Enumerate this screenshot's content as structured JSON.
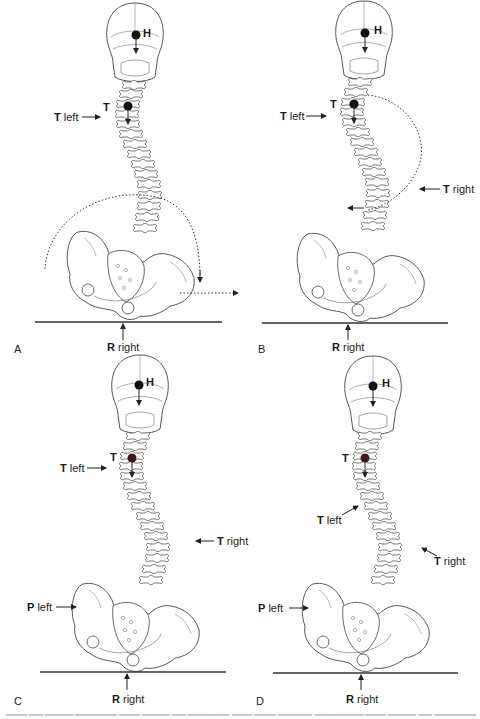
{
  "figure": {
    "type": "anatomical-diagram",
    "line_color": "#3a3a3a",
    "caption_visible": "illegible caption text (cut off)",
    "panels": [
      {
        "letter": "A",
        "labels": {
          "head": "H",
          "thorax": "T",
          "t_left": {
            "bold": "T",
            "text": " left"
          },
          "r_right": {
            "bold": "R",
            "text": " right"
          }
        },
        "annotations": [
          "dotted rotation arc around pelvis",
          "dotted arrow to right"
        ]
      },
      {
        "letter": "B",
        "labels": {
          "head": "H",
          "thorax": "T",
          "t_left": {
            "bold": "T",
            "text": " left"
          },
          "t_right": {
            "bold": "T",
            "text": " right"
          },
          "r_right": {
            "bold": "R",
            "text": " right"
          }
        },
        "annotations": [
          "dotted arc from upper thoracic to lumbar",
          "arrow pointing left at lumbar"
        ]
      },
      {
        "letter": "C",
        "labels": {
          "head": "H",
          "thorax": "T",
          "t_left": {
            "bold": "T",
            "text": " left"
          },
          "t_right": {
            "bold": "T",
            "text": " right"
          },
          "p_left": {
            "bold": "P",
            "text": " left"
          },
          "r_right": {
            "bold": "R",
            "text": " right"
          }
        }
      },
      {
        "letter": "D",
        "labels": {
          "head": "H",
          "thorax": "T",
          "t_left_upper": {
            "bold": "T",
            "text": " left"
          },
          "t_left_mid": {
            "bold": "T",
            "text": " left"
          },
          "t_right": {
            "bold": "T",
            "text": " right"
          },
          "p_left": {
            "bold": "P",
            "text": " left"
          },
          "r_right": {
            "bold": "R",
            "text": " right"
          }
        }
      }
    ]
  }
}
